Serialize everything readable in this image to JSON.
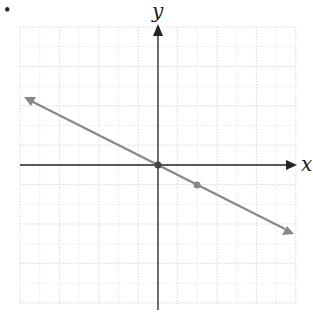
{
  "bullet": "•",
  "axes": {
    "x_label": "x",
    "y_label": "y"
  },
  "grid": {
    "x0": 20,
    "y0": 27,
    "x1": 296,
    "y1": 304,
    "step": 19.7,
    "origin_px": [
      158,
      165
    ]
  },
  "line": {
    "equation": "y = -x/2",
    "slope": -0.5,
    "intercept": 0,
    "color": "#888888"
  },
  "points": [
    {
      "x": 0,
      "y": 0
    },
    {
      "x": 2,
      "y": -1
    }
  ]
}
